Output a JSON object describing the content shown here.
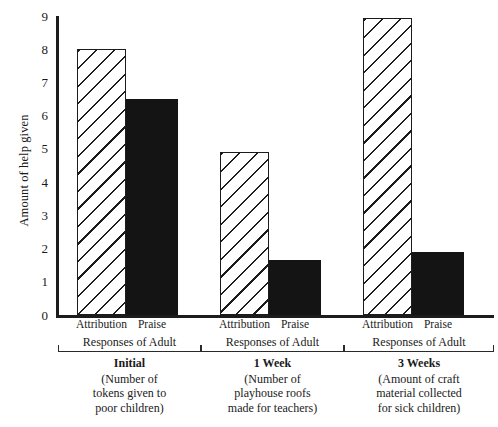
{
  "chart_data": {
    "type": "bar",
    "title": "",
    "subtitle": "",
    "xlabel": "",
    "ylabel": "Amount of help given",
    "ylim": [
      0,
      9
    ],
    "yticks": [
      0,
      1,
      2,
      3,
      4,
      5,
      6,
      7,
      8,
      9
    ],
    "ytick_labels": [
      "0",
      "1",
      "2",
      "3",
      "4",
      "5",
      "6",
      "7",
      "8",
      "9"
    ],
    "grid": false,
    "legend": false,
    "legend_position": "none",
    "categories": [
      "Initial",
      "1 Week",
      "3 Weeks"
    ],
    "series": [
      {
        "name": "Attribution",
        "style": "hatched",
        "values": [
          8.0,
          4.9,
          8.95
        ]
      },
      {
        "name": "Praise",
        "style": "solid",
        "values": [
          6.5,
          1.65,
          1.9
        ]
      }
    ],
    "groups": [
      {
        "bars": [
          {
            "condition": "Attribution",
            "value": 8.0,
            "style": "hatched"
          },
          {
            "condition": "Praise",
            "value": 6.5,
            "style": "solid"
          }
        ],
        "bracket_label": "Responses of Adult",
        "caption_title": "Initial",
        "caption_lines": [
          "(Number of",
          "tokens given to",
          "poor children)"
        ]
      },
      {
        "bars": [
          {
            "condition": "Attribution",
            "value": 4.9,
            "style": "hatched"
          },
          {
            "condition": "Praise",
            "value": 1.65,
            "style": "solid"
          }
        ],
        "bracket_label": "Responses of Adult",
        "caption_title": "1 Week",
        "caption_lines": [
          "(Number of",
          "playhouse roofs",
          "made for teachers)"
        ]
      },
      {
        "bars": [
          {
            "condition": "Attribution",
            "value": 8.95,
            "style": "hatched"
          },
          {
            "condition": "Praise",
            "value": 1.9,
            "style": "solid"
          }
        ],
        "bracket_label": "Responses of Adult",
        "caption_title": "3 Weeks",
        "caption_lines": [
          "(Amount of craft",
          "material collected",
          "for sick children)"
        ]
      }
    ],
    "colors": {
      "axis": "#1c1c1c",
      "solid_bar": "#141414",
      "hatch_line": "#1c1c1c",
      "hatch_background": "#ffffff",
      "text": "#1a1a1a",
      "background": "#ffffff"
    }
  }
}
